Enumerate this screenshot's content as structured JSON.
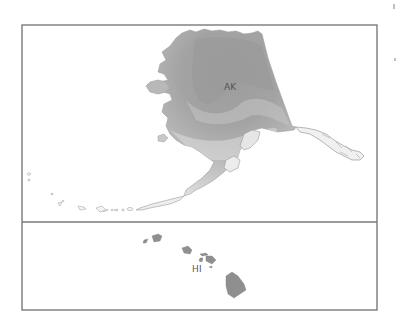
{
  "map": {
    "type": "choropleth-inset",
    "colors": {
      "frame": "#7a7a7a",
      "background": "#ffffff",
      "ak_darkest": "#9c9c9c",
      "ak_dark": "#a9a9a9",
      "ak_mid": "#bcbcbc",
      "ak_light": "#d2d2d2",
      "ak_lightest": "#e8e8e8",
      "hi_fill": "#8f8f8f",
      "outline": "#9a9a9a"
    },
    "panels": [
      {
        "id": "alaska",
        "label": "AK"
      },
      {
        "id": "hawaii",
        "label": "HI"
      }
    ]
  }
}
